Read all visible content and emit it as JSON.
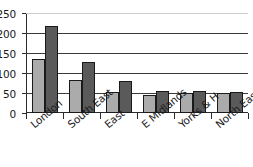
{
  "chart_data": {
    "type": "bar",
    "title": "",
    "xlabel": "",
    "ylabel": "",
    "categories": [
      "London",
      "South East",
      "East",
      "E Midlands",
      "Yorks & H",
      "North East"
    ],
    "series": [
      {
        "name": "Series 1",
        "color": "#ababab",
        "values": [
          135,
          82,
          53,
          45,
          50,
          49
        ]
      },
      {
        "name": "Series 2",
        "color": "#5a5a5a",
        "values": [
          218,
          128,
          80,
          56,
          56,
          52
        ]
      }
    ],
    "ylim": [
      0,
      250
    ],
    "ytick_values": [
      0,
      50,
      100,
      150,
      200,
      250
    ],
    "ytick_labels": [
      "0",
      "50",
      "100",
      "150",
      "200",
      "250"
    ],
    "grid": true,
    "grid_axis": "y",
    "legend": false,
    "legend_position": "none"
  },
  "axis": {
    "line_color": "#2b2b2b",
    "grid_color": "#3a3a3a"
  }
}
